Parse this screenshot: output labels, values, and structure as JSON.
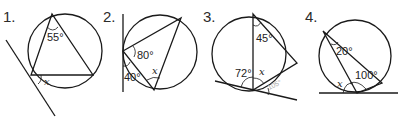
{
  "problems": [
    {
      "number": "1.",
      "angles": [
        {
          "label": "55°"
        }
      ],
      "unknown": "x"
    },
    {
      "number": "2.",
      "angles": [
        {
          "label": "80°"
        },
        {
          "label": "40°"
        }
      ],
      "unknown": "x"
    },
    {
      "number": "3.",
      "angles": [
        {
          "label": "45°"
        },
        {
          "label": "72°"
        }
      ],
      "unknown": "x",
      "faint_label": "105°"
    },
    {
      "number": "4.",
      "angles": [
        {
          "label": "20°"
        },
        {
          "label": "100°"
        }
      ],
      "unknown": "x"
    }
  ]
}
